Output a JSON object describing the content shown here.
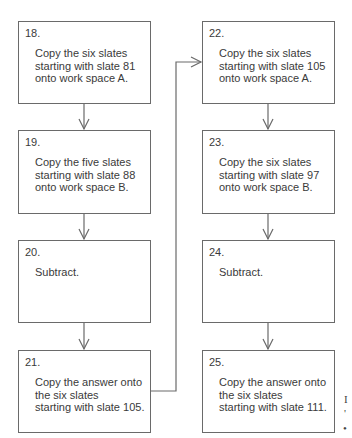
{
  "diagram": {
    "type": "flowchart",
    "columns": [
      {
        "steps": [
          {
            "number": "18.",
            "text": "Copy the six slates\nstarting with slate 81\nonto work space A."
          },
          {
            "number": "19.",
            "text": "Copy the five slates\nstarting with slate 88\nonto work space B."
          },
          {
            "number": "20.",
            "text": "Subtract."
          },
          {
            "number": "21.",
            "text": "Copy the answer onto\nthe six slates\nstarting with slate 105."
          }
        ]
      },
      {
        "steps": [
          {
            "number": "22.",
            "text": "Copy the six slates\nstarting with slate 105\nonto work space A."
          },
          {
            "number": "23.",
            "text": "Copy the six slates\nstarting with slate 97\nonto work space B."
          },
          {
            "number": "24.",
            "text": "Subtract."
          },
          {
            "number": "25.",
            "text": "Copy the answer onto\nthe six slates\nstarting with slate 111."
          }
        ]
      }
    ],
    "edges": [
      {
        "from": "18",
        "to": "19"
      },
      {
        "from": "19",
        "to": "20"
      },
      {
        "from": "20",
        "to": "21"
      },
      {
        "from": "21",
        "to": "22"
      },
      {
        "from": "22",
        "to": "23"
      },
      {
        "from": "23",
        "to": "24"
      },
      {
        "from": "24",
        "to": "25"
      }
    ],
    "cut_off_text": [
      "I",
      "'",
      "•"
    ],
    "colors": {
      "line": "#6a6a6a",
      "text": "#3a3a3a",
      "background": "#ffffff"
    }
  }
}
